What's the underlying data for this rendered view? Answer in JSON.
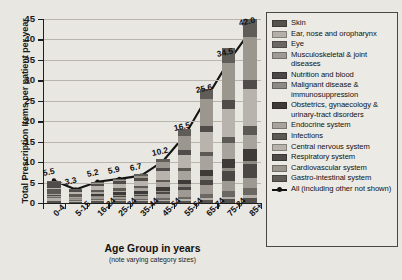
{
  "chart_data": {
    "type": "bar",
    "title": "",
    "xlabel": "Age Group in years",
    "xlabel_note": "(note varying category sizes)",
    "ylabel": "Total Prescription Items per patient per year",
    "ylim": [
      0,
      45
    ],
    "yticks": [
      0,
      5,
      10,
      15,
      20,
      25,
      30,
      35,
      40,
      45
    ],
    "grid": true,
    "legend_position": "right",
    "categories": [
      "0-4",
      "5-15",
      "16-24",
      "25-34",
      "35-44",
      "45-54",
      "55-64",
      "65-74",
      "75-84",
      "85+"
    ],
    "series": [
      {
        "name": "Skin",
        "color": "#55524e",
        "values": [
          0.55,
          0.3,
          0.45,
          0.4,
          0.4,
          0.45,
          0.55,
          0.75,
          0.95,
          1.25
        ]
      },
      {
        "name": "Ear, nose and oropharynx",
        "color": "#b4b0a9",
        "values": [
          0.7,
          0.35,
          0.35,
          0.3,
          0.3,
          0.35,
          0.4,
          0.5,
          0.6,
          0.8
        ]
      },
      {
        "name": "Eye",
        "color": "#6b6864",
        "values": [
          0.25,
          0.15,
          0.2,
          0.2,
          0.25,
          0.35,
          0.6,
          1.0,
          1.4,
          1.7
        ]
      },
      {
        "name": "Musculoskeletal & joint diseases",
        "color": "#9e9a93",
        "values": [
          0.15,
          0.2,
          0.45,
          0.55,
          0.75,
          1.1,
          1.6,
          2.1,
          2.4,
          2.3
        ]
      },
      {
        "name": "Nutrition and blood",
        "color": "#4a4744",
        "values": [
          0.35,
          0.2,
          0.2,
          0.25,
          0.3,
          0.45,
          0.8,
          1.4,
          2.4,
          3.6
        ]
      },
      {
        "name": "Malignant disease & immunosuppression",
        "color": "#8d8a84",
        "values": [
          0.05,
          0.05,
          0.1,
          0.15,
          0.2,
          0.35,
          0.6,
          0.85,
          0.9,
          0.7
        ]
      },
      {
        "name": "Obstetrics, gynaecology & urinary-tract disorders",
        "color": "#3d3a37",
        "values": [
          0.1,
          0.15,
          0.55,
          0.75,
          0.75,
          0.8,
          1.0,
          1.5,
          2.2,
          2.8
        ]
      },
      {
        "name": "Endocrine system",
        "color": "#a8a49d",
        "values": [
          0.1,
          0.15,
          0.3,
          0.45,
          0.7,
          1.3,
          2.3,
          3.3,
          3.9,
          3.6
        ]
      },
      {
        "name": "Infections",
        "color": "#5c5955",
        "values": [
          1.2,
          0.75,
          0.7,
          0.6,
          0.55,
          0.6,
          0.75,
          1.0,
          1.4,
          2.0
        ]
      },
      {
        "name": "Central nervous system",
        "color": "#b8b4ad",
        "values": [
          0.25,
          0.35,
          0.75,
          0.95,
          1.25,
          2.0,
          3.2,
          4.9,
          6.9,
          9.1
        ]
      },
      {
        "name": "Respiratory system",
        "color": "#4f4c49",
        "values": [
          1.55,
          0.55,
          0.75,
          0.7,
          0.65,
          0.8,
          1.1,
          1.55,
          2.05,
          2.3
        ]
      },
      {
        "name": "Cardiovascular system",
        "color": "#9b978f",
        "values": [
          0.05,
          0.05,
          0.1,
          0.25,
          0.55,
          1.45,
          3.6,
          6.6,
          9.2,
          10.4
        ]
      },
      {
        "name": "Gastro-intestinal system",
        "color": "#605d59",
        "values": [
          0.2,
          0.15,
          0.25,
          0.35,
          0.45,
          0.8,
          1.5,
          2.5,
          3.6,
          4.55
        ]
      }
    ],
    "line_series": {
      "name": "All (including other not shown)",
      "color": "#141414",
      "values": [
        5.5,
        3.3,
        5.2,
        5.9,
        6.7,
        10.2,
        16.5,
        25.6,
        34.5,
        42.0
      ],
      "labels": [
        "5.5",
        "3.3",
        "5.2",
        "5.9",
        "6.7",
        "10.2",
        "16.5",
        "25.6",
        "34.5",
        "42.0"
      ]
    }
  },
  "legend": {
    "items": [
      {
        "label": "Skin",
        "color": "#55524e",
        "type": "swatch"
      },
      {
        "label": "Ear, nose and oropharynx",
        "color": "#b4b0a9",
        "type": "swatch"
      },
      {
        "label": "Eye",
        "color": "#6b6864",
        "type": "swatch"
      },
      {
        "label": "Musculoskeletal & joint diseases",
        "color": "#9e9a93",
        "type": "swatch"
      },
      {
        "label": "Nutrition and blood",
        "color": "#4a4744",
        "type": "swatch"
      },
      {
        "label": "Malignant disease & immunosuppression",
        "color": "#8d8a84",
        "type": "swatch"
      },
      {
        "label": "Obstetrics, gynaecology & urinary-tract disorders",
        "color": "#3d3a37",
        "type": "swatch"
      },
      {
        "label": "Endocrine system",
        "color": "#a8a49d",
        "type": "swatch"
      },
      {
        "label": "Infections",
        "color": "#5c5955",
        "type": "swatch"
      },
      {
        "label": "Central nervous system",
        "color": "#b8b4ad",
        "type": "swatch"
      },
      {
        "label": "Respiratory system",
        "color": "#4f4c49",
        "type": "swatch"
      },
      {
        "label": "Cardiovascular system",
        "color": "#9b978f",
        "type": "swatch"
      },
      {
        "label": "Gastro-intestinal system",
        "color": "#605d59",
        "type": "swatch"
      },
      {
        "label": "All (including other not shown)",
        "color": "#141414",
        "type": "line"
      }
    ]
  }
}
